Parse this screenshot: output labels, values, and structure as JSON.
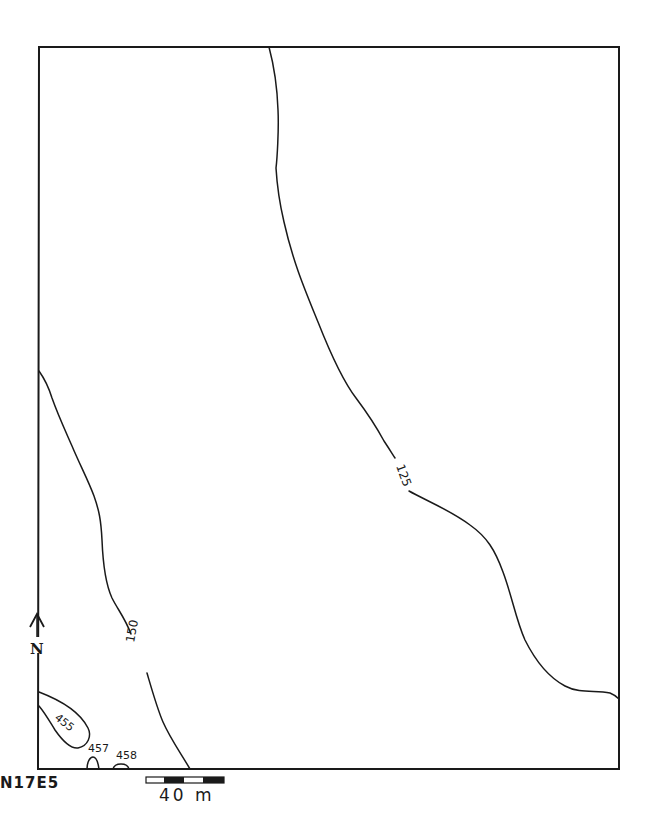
{
  "map": {
    "sheet_id": "N17E5",
    "north_label": "N",
    "scale": {
      "label": "40 m",
      "segments": [
        "white",
        "black",
        "white",
        "black"
      ]
    },
    "contours": [
      {
        "value": "125",
        "label": "125"
      },
      {
        "value": "150",
        "label": "150"
      }
    ],
    "features": [
      {
        "id": "455",
        "label": "455",
        "shape": "elongated-closed-outline"
      },
      {
        "id": "457",
        "label": "457",
        "shape": "small-mound"
      },
      {
        "id": "458",
        "label": "458",
        "shape": "small-mound"
      }
    ],
    "colors": {
      "ink": "#1a1a1a",
      "paper": "#ffffff"
    }
  }
}
